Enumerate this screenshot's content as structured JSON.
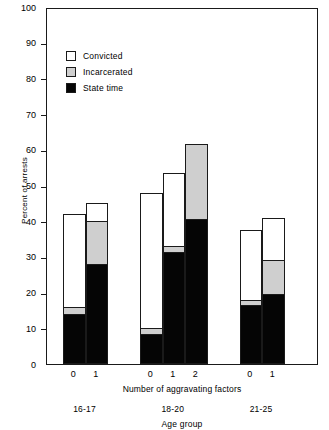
{
  "chart_data": {
    "type": "bar",
    "subtype": "stacked-grouped",
    "title": "",
    "xlabel": "Number of aggravating factors",
    "ylabel": "Percent of arrests",
    "ylim": [
      0,
      100
    ],
    "ytick_interval": 10,
    "yticks": [
      0,
      10,
      20,
      30,
      40,
      50,
      60,
      70,
      80,
      90,
      100
    ],
    "ytick_labels": [
      "0",
      "10",
      "20",
      "30",
      "40",
      "50",
      "60",
      "70",
      "80",
      "90",
      "100"
    ],
    "grid": false,
    "legend_position": "upper-left-inside",
    "secondary_xlabel": "Age group",
    "legend": [
      {
        "name": "Convicted",
        "color": "#ffffff"
      },
      {
        "name": "Incarcerated",
        "color": "#cfcfcf"
      },
      {
        "name": "State time",
        "color": "#050505"
      }
    ],
    "groups": [
      {
        "label": "16-17",
        "bars": [
          {
            "category": "0",
            "total": 42.0,
            "state_time": 14.0,
            "incarcerated": 16.0,
            "convicted": 42.0
          },
          {
            "category": "1",
            "total": 45.0,
            "state_time": 28.0,
            "incarcerated": 40.0,
            "convicted": 45.0
          }
        ]
      },
      {
        "label": "18-20",
        "bars": [
          {
            "category": "0",
            "total": 48.0,
            "state_time": 8.5,
            "incarcerated": 10.0,
            "convicted": 48.0
          },
          {
            "category": "1",
            "total": 53.5,
            "state_time": 31.5,
            "incarcerated": 33.0,
            "convicted": 53.5
          },
          {
            "category": "2",
            "total": 61.5,
            "state_time": 40.5,
            "incarcerated": 61.5,
            "convicted": 61.5
          }
        ]
      },
      {
        "label": "21-25",
        "bars": [
          {
            "category": "0",
            "total": 37.5,
            "state_time": 16.5,
            "incarcerated": 18.0,
            "convicted": 37.5
          },
          {
            "category": "1",
            "total": 41.0,
            "state_time": 19.5,
            "incarcerated": 29.0,
            "convicted": 41.0
          }
        ]
      }
    ]
  }
}
